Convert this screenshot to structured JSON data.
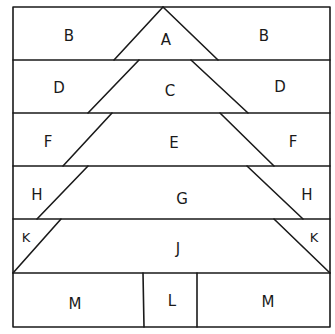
{
  "diagram": {
    "title": "",
    "colors": {
      "line": "#1a1a1a",
      "background": "#ffffff"
    },
    "frame": {
      "left": 13,
      "top": 7,
      "right": 330,
      "bottom": 327
    },
    "rows": [
      {
        "id": "row1",
        "center_label": "A",
        "side_label": "B"
      },
      {
        "id": "row2",
        "center_label": "C",
        "side_label": "D"
      },
      {
        "id": "row3",
        "center_label": "E",
        "side_label": "F"
      },
      {
        "id": "row4",
        "center_label": "G",
        "side_label": "H"
      },
      {
        "id": "row5",
        "center_label": "J",
        "side_label": "K"
      }
    ],
    "trunk_row": {
      "center_label": "L",
      "side_label": "M"
    },
    "pieces": [
      "A",
      "B",
      "C",
      "D",
      "E",
      "F",
      "G",
      "H",
      "J",
      "K",
      "L",
      "M"
    ]
  }
}
